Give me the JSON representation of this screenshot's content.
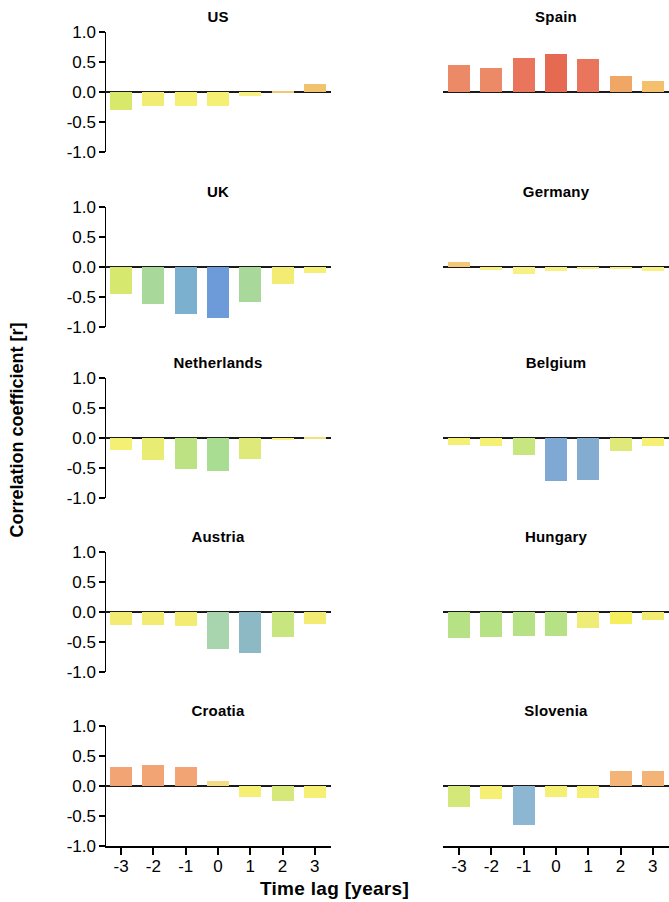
{
  "chart_data": {
    "type": "bar",
    "title": "",
    "xlabel": "Time lag [years]",
    "ylabel": "Correlation coefficient [r]",
    "x": [
      -3,
      -2,
      -1,
      0,
      1,
      2,
      3
    ],
    "xtick_labels": [
      "-3",
      "-2",
      "-1",
      "0",
      "1",
      "2",
      "3"
    ],
    "ytick_labels": [
      "1.0",
      "0.5",
      "0.0",
      "-0.5",
      "-1.0"
    ],
    "ytick_values": [
      1.0,
      0.5,
      0.0,
      -0.5,
      -1.0
    ],
    "ylim": [
      -1.0,
      1.0
    ],
    "grid": false,
    "legend": "none",
    "layout": "2 columns x 5 rows of small-multiple panels",
    "panels": [
      {
        "name": "US",
        "row": 0,
        "col": 0,
        "values": [
          -0.3,
          -0.24,
          -0.24,
          -0.24,
          -0.07,
          0.02,
          0.13
        ],
        "colors": [
          "#d8e86a",
          "#f2ed72",
          "#f5ef74",
          "#f5ef74",
          "#f7f082",
          "#f0c878",
          "#f2c36e"
        ]
      },
      {
        "name": "Spain",
        "row": 0,
        "col": 1,
        "values": [
          0.45,
          0.4,
          0.57,
          0.63,
          0.55,
          0.27,
          0.18
        ],
        "colors": [
          "#ec8a68",
          "#ec8a68",
          "#e8755c",
          "#e66a52",
          "#e8755c",
          "#f0a766",
          "#f4c06e"
        ]
      },
      {
        "name": "UK",
        "row": 1,
        "col": 0,
        "values": [
          -0.45,
          -0.62,
          -0.78,
          -0.85,
          -0.58,
          -0.28,
          -0.1
        ],
        "colors": [
          "#d6e86e",
          "#a8d89a",
          "#7cb0cf",
          "#6d9ad8",
          "#a8d89a",
          "#f2ed72",
          "#f5ef74"
        ]
      },
      {
        "name": "Germany",
        "row": 1,
        "col": 1,
        "values": [
          0.08,
          -0.05,
          -0.12,
          -0.06,
          -0.03,
          -0.04,
          -0.07
        ],
        "colors": [
          "#f4c878",
          "#f7f082",
          "#f7f082",
          "#f7f082",
          "#f7f082",
          "#f7f082",
          "#f7f082"
        ]
      },
      {
        "name": "Netherlands",
        "row": 2,
        "col": 0,
        "values": [
          -0.2,
          -0.37,
          -0.52,
          -0.55,
          -0.35,
          -0.03,
          0.02
        ],
        "colors": [
          "#f5ef74",
          "#e8ec72",
          "#bce284",
          "#a8dd92",
          "#dfe97a",
          "#f7f082",
          "#f4e07a"
        ]
      },
      {
        "name": "Belgium",
        "row": 2,
        "col": 1,
        "values": [
          -0.12,
          -0.13,
          -0.28,
          -0.72,
          -0.7,
          -0.22,
          -0.13
        ],
        "colors": [
          "#f5ef74",
          "#f5ef74",
          "#c8e680",
          "#7fa9d4",
          "#84acd0",
          "#dfe97a",
          "#f5ef74"
        ]
      },
      {
        "name": "Austria",
        "row": 3,
        "col": 0,
        "values": [
          -0.22,
          -0.22,
          -0.23,
          -0.62,
          -0.68,
          -0.42,
          -0.2
        ],
        "colors": [
          "#f2ed72",
          "#f2ed72",
          "#f2ed72",
          "#a8d5ae",
          "#8db9c4",
          "#c8e680",
          "#f2ed72"
        ]
      },
      {
        "name": "Hungary",
        "row": 3,
        "col": 1,
        "values": [
          -0.43,
          -0.42,
          -0.4,
          -0.4,
          -0.27,
          -0.2,
          -0.13
        ],
        "colors": [
          "#b6e285",
          "#b6e285",
          "#b6e285",
          "#b6e285",
          "#f0ec78",
          "#f5ef5e",
          "#f2ed72"
        ]
      },
      {
        "name": "Croatia",
        "row": 4,
        "col": 0,
        "values": [
          0.32,
          0.35,
          0.32,
          0.08,
          -0.18,
          -0.25,
          -0.2
        ],
        "colors": [
          "#f2a474",
          "#f2a474",
          "#f2a474",
          "#f4dc86",
          "#f5ef74",
          "#d6e87a",
          "#f5ef74"
        ]
      },
      {
        "name": "Slovenia",
        "row": 4,
        "col": 1,
        "values": [
          -0.35,
          -0.22,
          -0.65,
          -0.18,
          -0.2,
          0.25,
          0.25
        ],
        "colors": [
          "#d4e87a",
          "#f5ef74",
          "#8db6d2",
          "#f5ef74",
          "#f5ef74",
          "#f4b377",
          "#f4b377"
        ]
      }
    ]
  }
}
